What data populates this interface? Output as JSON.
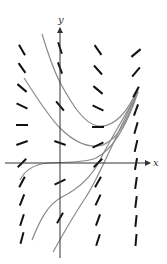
{
  "figure": {
    "type": "direction-field",
    "axes": {
      "x_label": "x",
      "y_label": "y",
      "origin_px": [
        60,
        163
      ],
      "x_axis": {
        "from": [
          5,
          163
        ],
        "to": [
          150,
          163
        ],
        "label_pos": [
          153,
          166
        ]
      },
      "y_axis": {
        "from": [
          60,
          258
        ],
        "to": [
          60,
          28
        ],
        "label_pos": [
          58,
          23
        ]
      }
    },
    "colors": {
      "axis": "#333333",
      "segment": "#111111",
      "curve": "#8a8a8a"
    },
    "slope_segments": [
      {
        "x": 22,
        "y": 50,
        "angle": 60
      },
      {
        "x": 22,
        "y": 68,
        "angle": 55
      },
      {
        "x": 22,
        "y": 88,
        "angle": 40
      },
      {
        "x": 22,
        "y": 106,
        "angle": 25
      },
      {
        "x": 22,
        "y": 125,
        "angle": 0
      },
      {
        "x": 22,
        "y": 143,
        "angle": -20
      },
      {
        "x": 22,
        "y": 163,
        "angle": -45
      },
      {
        "x": 22,
        "y": 182,
        "angle": -62
      },
      {
        "x": 22,
        "y": 200,
        "angle": -68
      },
      {
        "x": 22,
        "y": 220,
        "angle": -72
      },
      {
        "x": 22,
        "y": 238,
        "angle": -75
      },
      {
        "x": 60,
        "y": 48,
        "angle": 72
      },
      {
        "x": 60,
        "y": 68,
        "angle": 70
      },
      {
        "x": 60,
        "y": 106,
        "angle": 50
      },
      {
        "x": 60,
        "y": 143,
        "angle": 20
      },
      {
        "x": 60,
        "y": 182,
        "angle": -25
      },
      {
        "x": 60,
        "y": 218,
        "angle": -60
      },
      {
        "x": 98,
        "y": 50,
        "angle": 55
      },
      {
        "x": 98,
        "y": 70,
        "angle": 48
      },
      {
        "x": 98,
        "y": 90,
        "angle": 40
      },
      {
        "x": 98,
        "y": 108,
        "angle": 25
      },
      {
        "x": 98,
        "y": 127,
        "angle": 0
      },
      {
        "x": 98,
        "y": 145,
        "angle": -25
      },
      {
        "x": 98,
        "y": 163,
        "angle": -45
      },
      {
        "x": 98,
        "y": 182,
        "angle": -60
      },
      {
        "x": 98,
        "y": 200,
        "angle": -65
      },
      {
        "x": 98,
        "y": 220,
        "angle": -70
      },
      {
        "x": 98,
        "y": 240,
        "angle": -72
      },
      {
        "x": 136,
        "y": 53,
        "angle": -40
      },
      {
        "x": 136,
        "y": 72,
        "angle": -50
      },
      {
        "x": 136,
        "y": 92,
        "angle": -62
      },
      {
        "x": 136,
        "y": 110,
        "angle": -70
      },
      {
        "x": 136,
        "y": 128,
        "angle": -74
      },
      {
        "x": 136,
        "y": 146,
        "angle": -77
      },
      {
        "x": 136,
        "y": 164,
        "angle": -80
      },
      {
        "x": 136,
        "y": 183,
        "angle": -82
      },
      {
        "x": 136,
        "y": 202,
        "angle": -83
      },
      {
        "x": 136,
        "y": 221,
        "angle": -84
      },
      {
        "x": 136,
        "y": 240,
        "angle": -85
      }
    ],
    "solution_curves": [
      {
        "name": "curve-1",
        "d": "M42,34 C50,60 56,76 62,86 C72,104 84,124 98,126 C114,128 128,112 138,88"
      },
      {
        "name": "curve-2",
        "d": "M24,78 C36,96 48,116 60,128 C72,140 86,147 98,146 C116,144 128,120 138,90"
      },
      {
        "name": "curve-3",
        "d": "M20,180 C26,168 36,164 48,163 C66,162 84,163 96,158 C112,150 126,128 138,92"
      },
      {
        "name": "curve-4",
        "d": "M32,240 C40,220 48,204 62,197 C80,188 92,176 100,160 C110,140 124,118 138,92"
      },
      {
        "name": "curve-5",
        "d": "M53,252 C62,236 72,218 84,200 C96,182 104,162 112,146 C120,128 130,108 138,92"
      }
    ]
  }
}
